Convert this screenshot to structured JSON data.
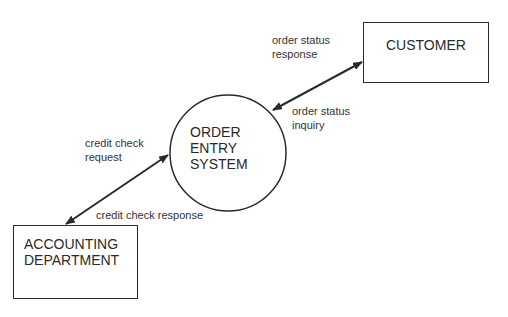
{
  "diagram": {
    "type": "context data flow diagram",
    "process": {
      "label_lines": [
        "ORDER",
        "ENTRY",
        "SYSTEM"
      ]
    },
    "entities": {
      "customer": {
        "label": "CUSTOMER"
      },
      "accounting": {
        "label_lines": [
          "ACCOUNTING",
          "DEPARTMENT"
        ]
      }
    },
    "flows": {
      "order_status_response": {
        "label_lines": [
          "order status",
          "response"
        ]
      },
      "order_status_inquiry": {
        "label_lines": [
          "order status",
          "inquiry"
        ]
      },
      "credit_check_request": {
        "label_lines": [
          "credit check",
          "request"
        ]
      },
      "credit_check_response": {
        "label": "credit check response"
      }
    },
    "colors": {
      "stroke": "#2a2a2a",
      "background": "#ffffff"
    }
  }
}
